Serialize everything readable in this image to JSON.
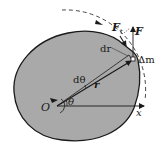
{
  "diagram": {
    "colors": {
      "body_fill": "#a9a9a9",
      "outline": "#1a1a1a",
      "background": "#ffffff"
    },
    "labels": {
      "origin": "O",
      "x_axis": "x",
      "angle": "θ",
      "d_angle": "dθ",
      "d_position": "dr",
      "position": "r",
      "mass_element": "Δm",
      "force": "F",
      "tangential_force": "F",
      "tangential_force_sub": "t"
    },
    "elements": [
      {
        "name": "rigid-body",
        "shape": "irregular closed curve, gray fill"
      },
      {
        "name": "x-axis",
        "from": "O",
        "direction": "right"
      },
      {
        "name": "position-vector-r",
        "from": "O",
        "to": "Δm"
      },
      {
        "name": "adjacent-ray",
        "angle_offset": "dθ"
      },
      {
        "name": "dashed-circular-path",
        "style": "dashed arc with arrow"
      },
      {
        "name": "force-F",
        "direction": "vertical up from Δm"
      },
      {
        "name": "force-Ft",
        "direction": "tangent to path"
      },
      {
        "name": "rotation-arrow-at-O",
        "direction": "counterclockwise"
      }
    ]
  }
}
